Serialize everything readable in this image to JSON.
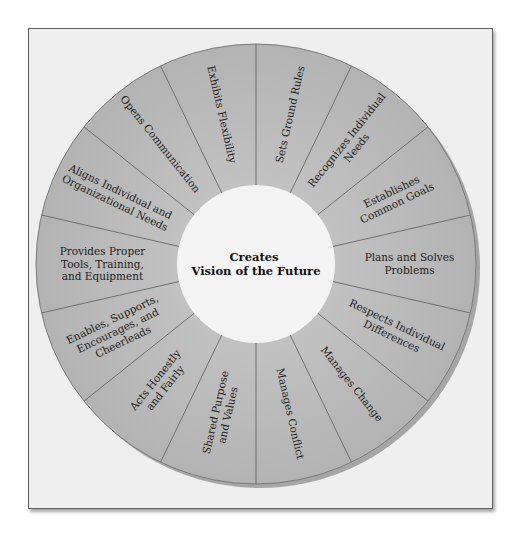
{
  "diagram": {
    "type": "wheel",
    "center": {
      "lines": [
        "Creates",
        "Vision of the Future"
      ]
    },
    "segments": [
      {
        "lines": [
          "Sets Ground Rules"
        ]
      },
      {
        "lines": [
          "Exhibits Flexibility"
        ]
      },
      {
        "lines": [
          "Opens Communication"
        ]
      },
      {
        "lines": [
          "Aligns Individual and",
          "Organizational Needs"
        ]
      },
      {
        "lines": [
          "Provides Proper",
          "Tools, Training,",
          "and Equipment"
        ]
      },
      {
        "lines": [
          "Enables, Supports,",
          "Encourages, and",
          "Cheerleads"
        ]
      },
      {
        "lines": [
          "Acts Honestly",
          "and Fairly"
        ]
      },
      {
        "lines": [
          "Shared Purpose",
          "and Values"
        ]
      },
      {
        "lines": [
          "Manages Conflict"
        ]
      },
      {
        "lines": [
          "Manages Change"
        ]
      },
      {
        "lines": [
          "Respects Individual",
          "Differences"
        ]
      },
      {
        "lines": [
          "Plans and Solves",
          "Problems"
        ]
      },
      {
        "lines": [
          "Establishes",
          "Common Goals"
        ]
      },
      {
        "lines": [
          "Recognizes Individual",
          "Needs"
        ]
      }
    ],
    "colors": {
      "segment_fill": "#b9b9b9",
      "segment_fill_light": "#cacaca",
      "spoke": "#6e6e6e",
      "center_fill": "#f4f4f4",
      "frame_bg": "#efefef",
      "rim_shadow": "#a3a3a3"
    }
  }
}
